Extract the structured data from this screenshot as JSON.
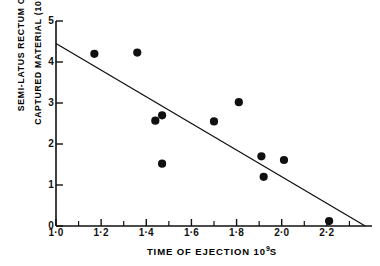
{
  "figure": {
    "background_color": "#ffffff",
    "ink_color": "#101010"
  },
  "axes": {
    "x": {
      "title_text": "TIME  OF  EJECTION  10",
      "title_exponent": "9",
      "title_unit": "S",
      "min": 1.0,
      "max": 2.4,
      "major_tick_labels": [
        "1·0",
        "1·2",
        "1·4",
        "1·6",
        "1·8",
        "2·0",
        "2·2"
      ],
      "major_tick_values": [
        1.0,
        1.2,
        1.4,
        1.6,
        1.8,
        2.0,
        2.2
      ],
      "minor_tick_values": [
        1.1,
        1.3,
        1.5,
        1.7,
        1.9,
        2.1,
        2.3
      ],
      "tick_interval": 0.1
    },
    "y": {
      "title_line1": "SEMI-LATUS  RECTUM  OF",
      "title_line2": "CAPTURED  MATERIAL  (10",
      "title_exponent": "-4",
      "title_unit": "cm)",
      "min": 0,
      "max": 5,
      "major_tick_labels": [
        "0",
        "1",
        "2",
        "3",
        "4",
        "5"
      ],
      "major_tick_values": [
        0,
        1,
        2,
        3,
        4,
        5
      ]
    }
  },
  "chart_data": {
    "type": "scatter",
    "title": "",
    "xlabel": "TIME OF EJECTION 10^9 S",
    "ylabel": "SEMI-LATUS RECTUM OF CAPTURED MATERIAL (10^-4 cm)",
    "xlim": [
      1.0,
      2.4
    ],
    "ylim": [
      0,
      5
    ],
    "grid": false,
    "legend": "none",
    "marker": "filled-circle",
    "marker_color": "#101010",
    "x": [
      1.17,
      1.36,
      1.44,
      1.47,
      1.47,
      1.7,
      1.81,
      1.91,
      1.92,
      2.01,
      2.21
    ],
    "y": [
      4.2,
      4.23,
      2.57,
      2.7,
      1.52,
      2.55,
      3.02,
      1.7,
      1.2,
      1.61,
      0.12
    ],
    "points": [
      {
        "x": 1.17,
        "y": 4.2
      },
      {
        "x": 1.36,
        "y": 4.23
      },
      {
        "x": 1.44,
        "y": 2.57
      },
      {
        "x": 1.47,
        "y": 2.7
      },
      {
        "x": 1.47,
        "y": 1.52
      },
      {
        "x": 1.7,
        "y": 2.55
      },
      {
        "x": 1.81,
        "y": 3.02
      },
      {
        "x": 1.91,
        "y": 1.7
      },
      {
        "x": 1.92,
        "y": 1.2
      },
      {
        "x": 2.01,
        "y": 1.61
      },
      {
        "x": 2.21,
        "y": 0.12
      }
    ],
    "fit_line": {
      "type": "line",
      "style": "solid",
      "x_start": 1.0,
      "y_start": 4.45,
      "x_end": 2.37,
      "y_end": 0.0
    }
  }
}
